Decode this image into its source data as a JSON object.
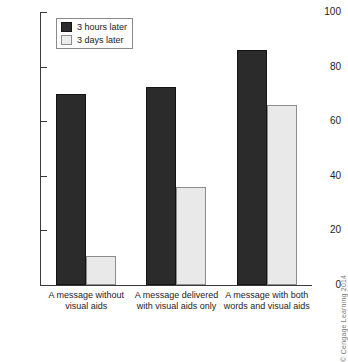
{
  "chart_data": {
    "type": "bar",
    "title": "",
    "xlabel": "",
    "ylabel": "",
    "ylim": [
      0,
      100
    ],
    "yticks": [
      0,
      20,
      40,
      60,
      80,
      100
    ],
    "grid": false,
    "legend_position": "top-left",
    "categories": [
      "A message without visual aids",
      "A message delivered with visual aids only",
      "A message with both words and visual aids"
    ],
    "category_lines": [
      [
        "A message without",
        "visual aids"
      ],
      [
        "A message delivered",
        "with visual aids only"
      ],
      [
        "A message with both",
        "words and visual aids"
      ]
    ],
    "series": [
      {
        "name": "3 hours later",
        "color": "#2b2b2b",
        "values": [
          70,
          72.5,
          86
        ]
      },
      {
        "name": "3 days later",
        "color": "#e9e9e9",
        "values": [
          10.5,
          36,
          66
        ]
      }
    ]
  },
  "legend": {
    "items": [
      {
        "label": "3 hours later"
      },
      {
        "label": "3 days later"
      }
    ]
  },
  "axis": {
    "tick_labels": [
      "100",
      "80",
      "60",
      "40",
      "20",
      "0"
    ]
  },
  "credit": {
    "text": "© Cengage Learning 2014"
  }
}
